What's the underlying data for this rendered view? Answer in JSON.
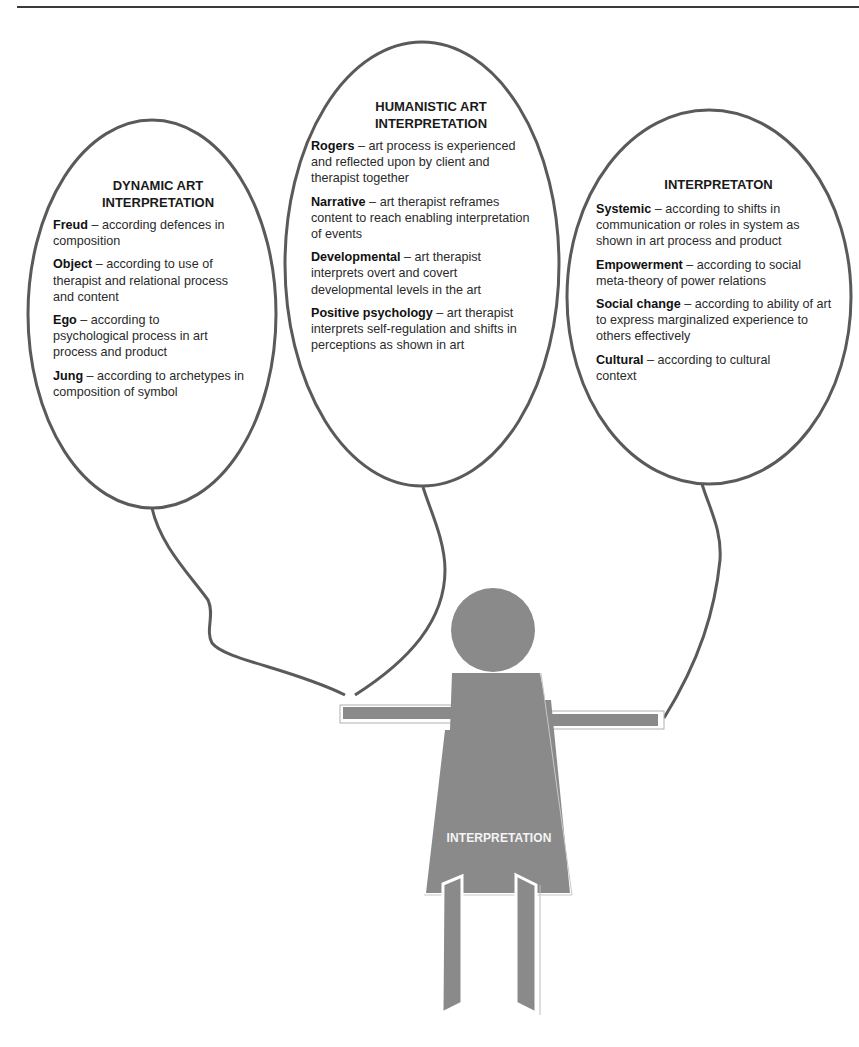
{
  "colors": {
    "balloon_outline": "#5a5a5a",
    "figure_fill": "#8a8a8a",
    "figure_label": "#f4f4f4",
    "text": "#2a2a2a",
    "rule": "#3a3a3a"
  },
  "balloons": [
    {
      "title_line1": "DYNAMIC ART",
      "title_line2": "INTERPRETATION",
      "entries": [
        {
          "term": "Freud",
          "sep": " – ",
          "desc": "according defences in composition"
        },
        {
          "term": "Object",
          "sep": " – ",
          "desc": "according to use of therapist and relational process and content"
        },
        {
          "term": "Ego",
          "sep": " – ",
          "desc": "according to psychological process in art process and product"
        },
        {
          "term": "Jung",
          "sep": " – ",
          "desc": "according to archetypes in composition of symbol"
        }
      ]
    },
    {
      "title_line1": "HUMANISTIC ART",
      "title_line2": "INTERPRETATION",
      "entries": [
        {
          "term": "Rogers",
          "sep": " – ",
          "desc": "art process is experienced and reflected upon by client and therapist together"
        },
        {
          "term": "Narrative",
          "sep": " – ",
          "desc": "art therapist reframes content to reach enabling interpretation of events"
        },
        {
          "term": "Developmental",
          "sep": " – ",
          "desc": "art therapist interprets overt and covert developmental levels in the art"
        },
        {
          "term": "Positive psychology",
          "sep": " – ",
          "desc": "art therapist interprets self-regulation and shifts in perceptions as shown in art"
        }
      ]
    },
    {
      "title_line1": "INTERPRETATON",
      "title_line2": "",
      "entries": [
        {
          "term": "Systemic",
          "sep": " – ",
          "desc": "according to shifts in communication or roles in system as shown in art process and product"
        },
        {
          "term": "Empowerment",
          "sep": " – ",
          "desc": "according to social meta-theory of power relations"
        },
        {
          "term": "Social change",
          "sep": " – ",
          "desc": "according to ability of art to express marginalized experience to others effectively"
        },
        {
          "term": "Cultural",
          "sep": " – ",
          "desc": "according to cultural context"
        }
      ]
    }
  ],
  "figure": {
    "label": "INTERPRETATION"
  }
}
